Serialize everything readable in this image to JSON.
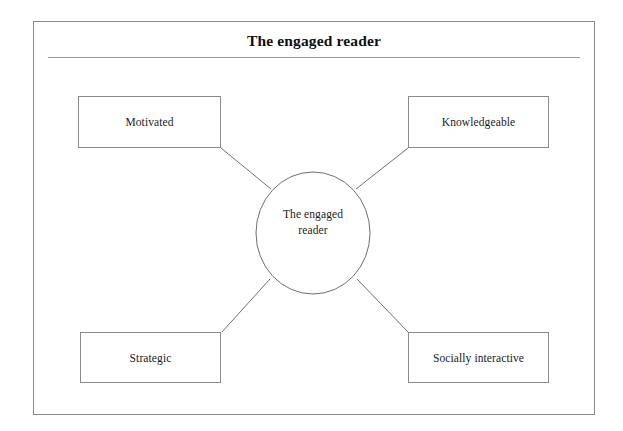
{
  "page": {
    "background_color": "#ffffff",
    "width": 623,
    "height": 431
  },
  "frame": {
    "border_color": "#8a8a8a"
  },
  "header": {
    "title": "The engaged reader",
    "rule_color": "#9a9a9a"
  },
  "diagram": {
    "type": "hub-and-spoke",
    "line_color": "#6f6f6f",
    "hub": {
      "shape": "ellipse",
      "label_line_1": "The engaged",
      "label_line_2": "reader",
      "label_full": "The engaged reader",
      "center_x": 313,
      "center_y": 233,
      "radius_x": 57,
      "radius_y": 61
    },
    "nodes": [
      {
        "id": "motivated",
        "label": "Motivated",
        "position": "top-left"
      },
      {
        "id": "knowledgeable",
        "label": "Knowledgeable",
        "position": "top-right"
      },
      {
        "id": "strategic",
        "label": "Strategic",
        "position": "bottom-left"
      },
      {
        "id": "socially-interactive",
        "label": "Socially interactive",
        "position": "bottom-right"
      }
    ],
    "connectors": [
      {
        "from": "motivated",
        "to": "hub",
        "x1": 221,
        "y1": 148,
        "x2": 271,
        "y2": 189
      },
      {
        "from": "knowledgeable",
        "to": "hub",
        "x1": 408,
        "y1": 148,
        "x2": 356,
        "y2": 189
      },
      {
        "from": "strategic",
        "to": "hub",
        "x1": 222,
        "y1": 332,
        "x2": 270,
        "y2": 279
      },
      {
        "from": "socially-interactive",
        "to": "hub",
        "x1": 408,
        "y1": 332,
        "x2": 357,
        "y2": 279
      }
    ]
  }
}
